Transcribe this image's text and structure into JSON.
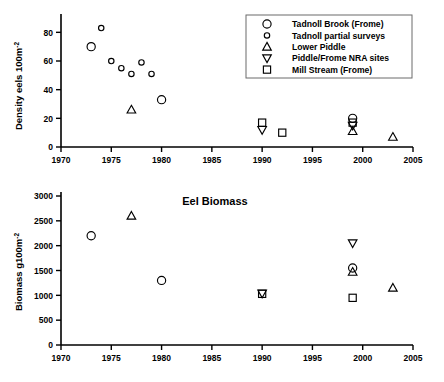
{
  "figure": {
    "legend": {
      "items": [
        {
          "label": "Tadnoll Brook (Frome)",
          "marker": "circle-large"
        },
        {
          "label": "Tadnoll partial surveys",
          "marker": "circle-small"
        },
        {
          "label": "Lower Piddle",
          "marker": "triangle-up"
        },
        {
          "label": "Piddle/Frome NRA sites",
          "marker": "triangle-down"
        },
        {
          "label": "Mill Stream (Frome)",
          "marker": "square"
        }
      ]
    }
  },
  "chart_data": [
    {
      "type": "scatter",
      "title": "",
      "xlabel": "",
      "ylabel": "Density eels  100m",
      "ylabel_sup": "-2",
      "xlim": [
        1970,
        2005
      ],
      "ylim": [
        0,
        90
      ],
      "xticks": [
        1970,
        1975,
        1980,
        1985,
        1990,
        1995,
        2000,
        2005
      ],
      "yticks": [
        0,
        20,
        40,
        60,
        80
      ],
      "grid": false,
      "legend_position": "top-right",
      "series": [
        {
          "name": "Tadnoll Brook (Frome)",
          "marker": "circle-large",
          "points": [
            [
              1973,
              70
            ],
            [
              1980,
              33
            ],
            [
              1999,
              20
            ]
          ]
        },
        {
          "name": "Tadnoll partial surveys",
          "marker": "circle-small",
          "points": [
            [
              1974,
              83
            ],
            [
              1975,
              60
            ],
            [
              1976,
              55
            ],
            [
              1977,
              51
            ],
            [
              1978,
              59
            ],
            [
              1979,
              51
            ]
          ]
        },
        {
          "name": "Lower Piddle",
          "marker": "triangle-up",
          "points": [
            [
              1977,
              26
            ],
            [
              1999,
              11
            ],
            [
              2003,
              7
            ]
          ]
        },
        {
          "name": "Piddle/Frome NRA sites",
          "marker": "triangle-down",
          "points": [
            [
              1990,
              12
            ],
            [
              1999,
              15
            ]
          ]
        },
        {
          "name": "Mill Stream (Frome)",
          "marker": "square",
          "points": [
            [
              1990,
              17
            ],
            [
              1992,
              10
            ],
            [
              1999,
              17
            ]
          ]
        }
      ]
    },
    {
      "type": "scatter",
      "title": "Eel Biomass",
      "xlabel": "",
      "ylabel": "Biomass  g100m",
      "ylabel_sup": "-2",
      "xlim": [
        1970,
        2005
      ],
      "ylim": [
        0,
        3000
      ],
      "xticks": [
        1970,
        1975,
        1980,
        1985,
        1990,
        1995,
        2000,
        2005
      ],
      "yticks": [
        0,
        500,
        1000,
        1500,
        2000,
        2500,
        3000
      ],
      "grid": false,
      "legend_position": "none",
      "series": [
        {
          "name": "Tadnoll Brook (Frome)",
          "marker": "circle-large",
          "points": [
            [
              1973,
              2200
            ],
            [
              1980,
              1300
            ],
            [
              1999,
              1550
            ]
          ]
        },
        {
          "name": "Lower Piddle",
          "marker": "triangle-up",
          "points": [
            [
              1977,
              2600
            ],
            [
              1999,
              1470
            ],
            [
              2003,
              1150
            ]
          ]
        },
        {
          "name": "Piddle/Frome NRA sites",
          "marker": "triangle-down",
          "points": [
            [
              1990,
              1040
            ],
            [
              1999,
              2050
            ]
          ]
        },
        {
          "name": "Mill Stream (Frome)",
          "marker": "square",
          "points": [
            [
              1990,
              1030
            ],
            [
              1999,
              950
            ]
          ]
        }
      ]
    }
  ]
}
